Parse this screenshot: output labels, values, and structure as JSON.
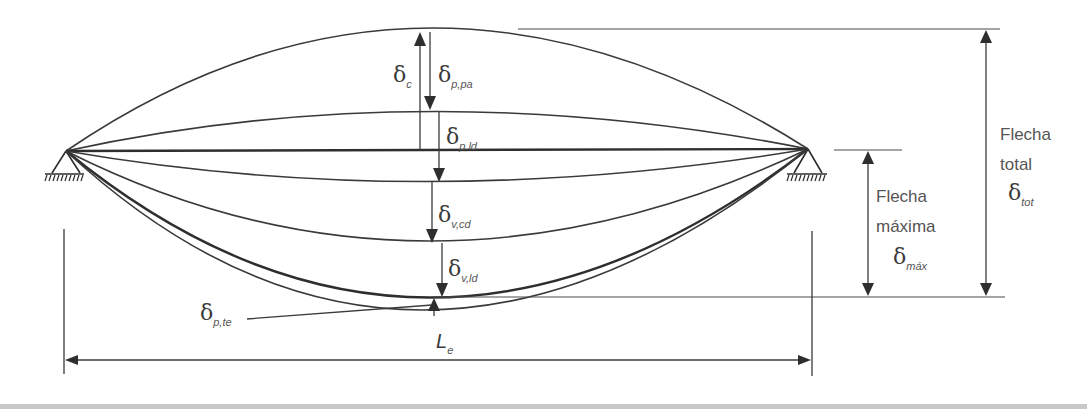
{
  "figure": {
    "span_label": {
      "symbol": "L",
      "subscript": "e"
    },
    "deflection_labels": {
      "camber": {
        "symbol": "δ",
        "subscript": "c"
      },
      "prestress_instant": {
        "symbol": "δ",
        "subscript": "p,pa"
      },
      "prestress_long_term": {
        "symbol": "δ",
        "subscript": "p,ld"
      },
      "variable_short": {
        "symbol": "δ",
        "subscript": "v,cd"
      },
      "variable_long": {
        "symbol": "δ",
        "subscript": "v,ld"
      },
      "prestress_thermal": {
        "symbol": "δ",
        "subscript": "p,te"
      }
    },
    "max_deflection": {
      "line1": "Flecha",
      "line2": "máxima",
      "symbol": "δ",
      "subscript": "máx"
    },
    "total_deflection": {
      "line1": "Flecha",
      "line2": "total",
      "symbol": "δ",
      "subscript": "tot"
    }
  },
  "colors": {
    "line": "#3a3a3a",
    "text": "#555555",
    "background": "#ffffff"
  }
}
